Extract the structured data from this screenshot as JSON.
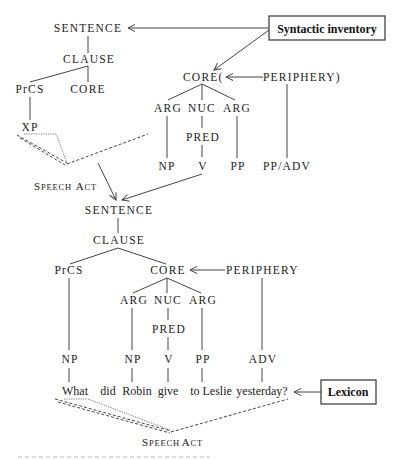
{
  "figure": {
    "top_tree": {
      "sentence": "SENTENCE",
      "clause": "CLAUSE",
      "prcs": "PrCS",
      "core": "CORE",
      "xp": "XP",
      "speech_act_cap1": "S",
      "speech_act_rest1": "PEECH",
      "speech_act_cap2": "A",
      "speech_act_rest2": "CT"
    },
    "syntactic_inventory": {
      "label": "Syntactic inventory",
      "core_template": "CORE(",
      "periphery_template": "PERIPHERY)",
      "args": [
        "ARG",
        "NUC",
        "ARG"
      ],
      "pred": "PRED",
      "leaves": [
        "NP",
        "V",
        "PP",
        "PP/ADV"
      ]
    },
    "linked_tree": {
      "sentence": "SENTENCE",
      "clause": "CLAUSE",
      "prcs": "PrCS",
      "core": "CORE",
      "periphery": "PERIPHERY",
      "args": [
        "ARG",
        "NUC",
        "ARG"
      ],
      "pred": "PRED",
      "phrases": [
        "NP",
        "NP",
        "V",
        "PP",
        "ADV"
      ],
      "words": [
        "What",
        "did",
        "Robin",
        "give",
        "to Leslie",
        "yesterday?"
      ],
      "speech_act_cap1": "S",
      "speech_act_rest1": "PEECH",
      "speech_act_cap2": "A",
      "speech_act_rest2": "CT"
    },
    "lexicon": {
      "label": "Lexicon"
    }
  }
}
